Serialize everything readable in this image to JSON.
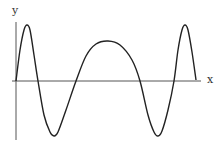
{
  "chart_data": {
    "type": "line",
    "title": "",
    "xlabel": "x",
    "ylabel": "y",
    "grid": false,
    "legend": null,
    "axis_origin_px": [
      16,
      81
    ],
    "points_px": [
      [
        16,
        81
      ],
      [
        20,
        50
      ],
      [
        24,
        30
      ],
      [
        27,
        25
      ],
      [
        30,
        30
      ],
      [
        34,
        55
      ],
      [
        38,
        81
      ],
      [
        44,
        115
      ],
      [
        50,
        132
      ],
      [
        54,
        136
      ],
      [
        58,
        132
      ],
      [
        66,
        110
      ],
      [
        76,
        81
      ],
      [
        86,
        56
      ],
      [
        96,
        44
      ],
      [
        108,
        41
      ],
      [
        120,
        45
      ],
      [
        132,
        60
      ],
      [
        140,
        81
      ],
      [
        148,
        115
      ],
      [
        154,
        132
      ],
      [
        158,
        136
      ],
      [
        162,
        131
      ],
      [
        168,
        110
      ],
      [
        174,
        81
      ],
      [
        178,
        50
      ],
      [
        182,
        30
      ],
      [
        185,
        25
      ],
      [
        188,
        30
      ],
      [
        192,
        52
      ],
      [
        196,
        80
      ]
    ]
  },
  "labels": {
    "x": "x",
    "y": "y"
  },
  "colors": {
    "curve": "#222222",
    "axis": "#555555"
  }
}
